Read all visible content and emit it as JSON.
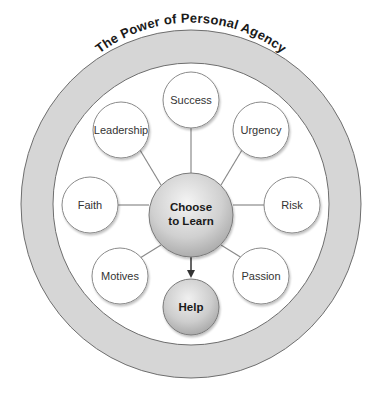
{
  "diagram": {
    "title": "The Power of Personal Agency",
    "hub": {
      "line1": "Choose",
      "line2": "to Learn"
    },
    "outcome": {
      "label": "Help"
    },
    "nodes": [
      {
        "id": "success",
        "label": "Success"
      },
      {
        "id": "urgency",
        "label": "Urgency"
      },
      {
        "id": "risk",
        "label": "Risk"
      },
      {
        "id": "passion",
        "label": "Passion"
      },
      {
        "id": "motives",
        "label": "Motives"
      },
      {
        "id": "faith",
        "label": "Faith"
      },
      {
        "id": "leadership",
        "label": "Leadership"
      }
    ],
    "colors": {
      "ring_fill": "#d6d6d6",
      "ring_stroke": "#6e6e6e",
      "node_fill": "#ffffff",
      "node_stroke": "#8a8a8a",
      "connector": "#8a8a8a",
      "arrow": "#333333",
      "hub_light": "#f2f2f2",
      "hub_dark": "#a9a9a9"
    }
  }
}
